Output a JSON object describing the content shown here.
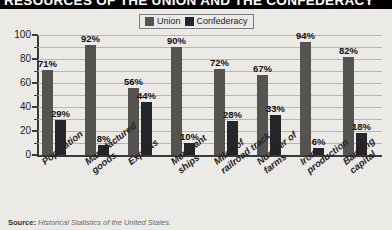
{
  "title": "RESOURCES OF THE UNION AND THE CONFEDERACY",
  "legend": {
    "entries": [
      {
        "label": "Union",
        "color": "#54534f",
        "swatch_name": "union-swatch"
      },
      {
        "label": "Confederacy",
        "color": "#26262a",
        "swatch_name": "confederacy-swatch"
      }
    ]
  },
  "source": {
    "label": "Source:",
    "text": "Historical Statistics of the United States."
  },
  "axis": {
    "y_ticks": [
      "100",
      "80",
      "60",
      "40",
      "20",
      "0"
    ]
  },
  "chart_data": {
    "type": "bar",
    "title": "RESOURCES OF THE UNION AND THE CONFEDERACY",
    "xlabel": "",
    "ylabel": "",
    "ylim": [
      0,
      100
    ],
    "ytick_step": 20,
    "yminor_step": 10,
    "grid": true,
    "legend_position": "top-center",
    "value_suffix": "%",
    "categories": [
      "Population",
      "Manufactured goods",
      "Exports",
      "Merchant ships",
      "Miles of railroad track",
      "Number of farms",
      "Iron production",
      "Banking capital"
    ],
    "series": [
      {
        "name": "Union",
        "color": "#54534f",
        "values": [
          71,
          92,
          56,
          90,
          72,
          67,
          94,
          82
        ],
        "labels": [
          "71%",
          "92%",
          "56%",
          "90%",
          "72%",
          "67%",
          "94%",
          "82%"
        ]
      },
      {
        "name": "Confederacy",
        "color": "#26262a",
        "values": [
          29,
          8,
          44,
          10,
          28,
          33,
          6,
          18
        ],
        "labels": [
          "29%",
          "8%",
          "44%",
          "10%",
          "28%",
          "33%",
          "6%",
          "18%"
        ]
      }
    ]
  }
}
